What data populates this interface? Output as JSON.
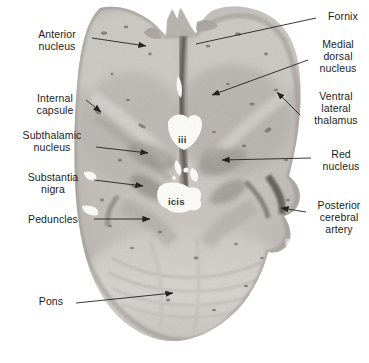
{
  "figure": {
    "kind": "labeled-anatomical-photograph",
    "background_color": "#ffffff",
    "tissue_color": "#b9b6b1",
    "line_color": "#232323"
  },
  "labels_left": [
    {
      "id": "anterior-nucleus",
      "text": "Anterior\nnucleus",
      "x": 24,
      "y": 28,
      "width": 66
    },
    {
      "id": "internal-capsule",
      "text": "Internal\ncapsule",
      "x": 22,
      "y": 92,
      "width": 66
    },
    {
      "id": "subthalamic-nucleus",
      "text": "Subthalamic\nnucleus",
      "x": 8,
      "y": 129,
      "width": 88
    },
    {
      "id": "substantia-nigra",
      "text": "Substantia\nnigra",
      "x": 14,
      "y": 171,
      "width": 78
    },
    {
      "id": "peduncles",
      "text": "Peduncles",
      "x": 14,
      "y": 213,
      "width": 78
    },
    {
      "id": "pons",
      "text": "Pons",
      "x": 30,
      "y": 295,
      "width": 42
    }
  ],
  "labels_right": [
    {
      "id": "fornix",
      "text": "Fornix",
      "x": 321,
      "y": 10,
      "width": 44
    },
    {
      "id": "medial-dorsal-nucleus",
      "text": "Medial\ndorsal\nnucleus",
      "x": 310,
      "y": 38,
      "width": 56
    },
    {
      "id": "ventral-lateral-thalamus",
      "text": "Ventral\nlateral\nthalamus",
      "x": 305,
      "y": 90,
      "width": 62
    },
    {
      "id": "red-nucleus",
      "text": "Red\nnucleus",
      "x": 316,
      "y": 148,
      "width": 50
    },
    {
      "id": "posterior-cerebral-artery",
      "text": "Posterior\ncerebral\nartery",
      "x": 310,
      "y": 199,
      "width": 58
    }
  ],
  "labels_inline": [
    {
      "id": "third-ventricle",
      "text": "iii",
      "x": 178,
      "y": 134
    },
    {
      "id": "interpeduncular-cistern",
      "text": "icis",
      "x": 168,
      "y": 196
    }
  ],
  "leaders": [
    {
      "id": "leader-anterior-nucleus",
      "type": "arrow",
      "points": "92,38 146,46"
    },
    {
      "id": "leader-internal-capsule",
      "type": "arrow",
      "points": "86,100 101,112"
    },
    {
      "id": "leader-subthalamic-nucleus",
      "type": "arrow",
      "points": "96,147 148,153"
    },
    {
      "id": "leader-substantia-nigra",
      "type": "arrow",
      "points": "94,180 143,186"
    },
    {
      "id": "leader-peduncles",
      "type": "arrow",
      "points": "94,219 150,219"
    },
    {
      "id": "leader-pons",
      "type": "arrow",
      "points": "76,303 173,293"
    },
    {
      "id": "leader-fornix",
      "type": "line",
      "points": "316,18 196,44"
    },
    {
      "id": "leader-medial-dorsal-nucleus",
      "type": "arrow",
      "points": "308,60 212,95"
    },
    {
      "id": "leader-ventral-lateral-thalamus",
      "type": "arrow",
      "points": "300,115 277,92"
    },
    {
      "id": "leader-red-nucleus",
      "type": "arrow",
      "points": "311,158 222,160"
    },
    {
      "id": "leader-posterior-cerebral-artery",
      "type": "arrow",
      "points": "306,212 281,208"
    }
  ]
}
